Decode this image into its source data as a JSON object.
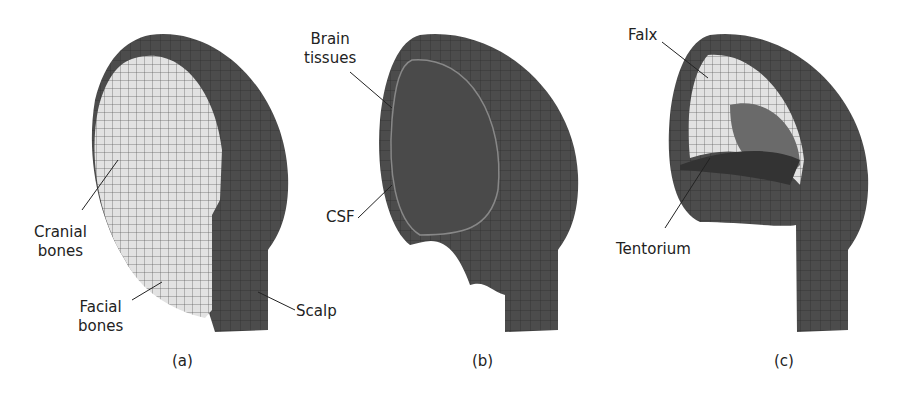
{
  "figure": {
    "panels": [
      {
        "caption": "(a)",
        "labels": {
          "cranial": "Cranial\nbones",
          "cranial_l1": "Cranial",
          "cranial_l2": "bones",
          "facial_l1": "Facial",
          "facial_l2": "bones",
          "scalp": "Scalp"
        }
      },
      {
        "caption": "(b)",
        "labels": {
          "brain_l1": "Brain",
          "brain_l2": "tissues",
          "csf": "CSF"
        }
      },
      {
        "caption": "(c)",
        "labels": {
          "falx": "Falx",
          "tentorium": "Tentorium"
        }
      }
    ],
    "colors": {
      "dark": "#4a4a4a",
      "light": "#dcdcdc",
      "mesh": "#333333"
    }
  }
}
